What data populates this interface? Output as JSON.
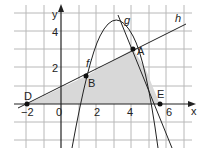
{
  "axes": {
    "x_label": "x",
    "y_label": "y"
  },
  "x_ticks": [
    "−2",
    "0",
    "2",
    "4",
    "6"
  ],
  "y_ticks": [
    "2",
    "4"
  ],
  "curves": {
    "f": "f",
    "g": "g",
    "h": "h"
  },
  "points": {
    "A": "A",
    "B": "B",
    "D": "D",
    "E": "E"
  },
  "colors": {
    "grid": "#b8b8b8",
    "shade": "#d8d8d8",
    "line": "#222222"
  }
}
